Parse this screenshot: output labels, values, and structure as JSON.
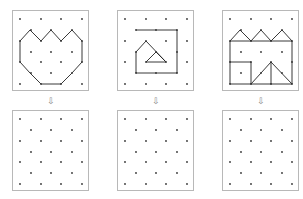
{
  "panels": [
    {
      "id": "top-1",
      "x": 12,
      "y": 10,
      "w": 77,
      "h": 81
    },
    {
      "id": "top-2",
      "x": 117,
      "y": 10,
      "w": 77,
      "h": 81
    },
    {
      "id": "top-3",
      "x": 222,
      "y": 10,
      "w": 77,
      "h": 81
    },
    {
      "id": "bottom-1",
      "x": 12,
      "y": 110,
      "w": 77,
      "h": 81
    },
    {
      "id": "bottom-2",
      "x": 117,
      "y": 110,
      "w": 77,
      "h": 81
    },
    {
      "id": "bottom-3",
      "x": 222,
      "y": 110,
      "w": 77,
      "h": 81
    }
  ],
  "arrows": [
    {
      "glyph": "⇩",
      "x": 45,
      "y": 97
    },
    {
      "glyph": "⇩",
      "x": 150,
      "y": 97
    },
    {
      "glyph": "⇩",
      "x": 255,
      "y": 97
    }
  ],
  "dot_grid": {
    "even_cols": [
      8,
      29,
      49,
      70
    ],
    "odd_cols": [
      19,
      39,
      60
    ],
    "rows": [
      9,
      20,
      31,
      42,
      52,
      63,
      74
    ]
  },
  "colors": {
    "line": "#222222",
    "dot": "#333333",
    "border": "#b8b8b8"
  }
}
